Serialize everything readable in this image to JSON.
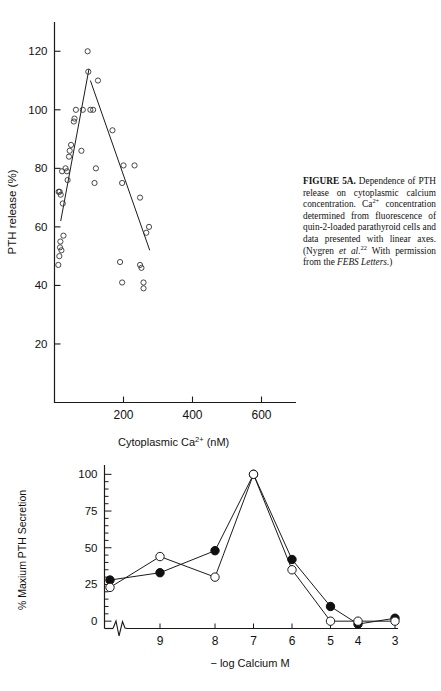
{
  "figure": {
    "caption": {
      "label": "FIGURE 5A.",
      "body_part1": " Dependence of PTH release on cytoplasmic calcium concentration. Ca",
      "sup1": "2+",
      "body_part2": " concentration determined from fluorescence of quin-2-loaded parathyroid cells and data presented with linear axes. (Nygren ",
      "italic1": "et al.",
      "sup2": "22",
      "body_part3": " With permission from the ",
      "italic2": "FEBS Letters.",
      "body_part4": ")"
    }
  },
  "chart_data": [
    {
      "id": "top-scatter",
      "type": "scatter",
      "title": "",
      "xlabel": "Cytoplasmic Ca2+ (nM)",
      "xlabel_base": "Cytoplasmic Ca",
      "xlabel_sup": "2+",
      "xlabel_unit": "(nM)",
      "ylabel": "PTH release (%)",
      "xlim": [
        0,
        700
      ],
      "ylim": [
        0,
        130
      ],
      "xticks": [
        200,
        400,
        600
      ],
      "yticks": [
        20,
        40,
        60,
        80,
        100,
        120
      ],
      "grid": false,
      "legend": "none",
      "marker": "open-circle",
      "points": [
        [
          11,
          47
        ],
        [
          14,
          50
        ],
        [
          16,
          53
        ],
        [
          17,
          55
        ],
        [
          20,
          52
        ],
        [
          26,
          57
        ],
        [
          12,
          72
        ],
        [
          15,
          72
        ],
        [
          18,
          71
        ],
        [
          24,
          68
        ],
        [
          22,
          79
        ],
        [
          32,
          80
        ],
        [
          36,
          79
        ],
        [
          38,
          76
        ],
        [
          42,
          84
        ],
        [
          44,
          86
        ],
        [
          48,
          88
        ],
        [
          56,
          96
        ],
        [
          58,
          97
        ],
        [
          62,
          100
        ],
        [
          78,
          86
        ],
        [
          82,
          100
        ],
        [
          96,
          120
        ],
        [
          98,
          113
        ],
        [
          104,
          100
        ],
        [
          112,
          100
        ],
        [
          126,
          110
        ],
        [
          120,
          80
        ],
        [
          116,
          75
        ],
        [
          168,
          93
        ],
        [
          200,
          81
        ],
        [
          232,
          81
        ],
        [
          196,
          75
        ],
        [
          248,
          70
        ],
        [
          274,
          60
        ],
        [
          266,
          58
        ],
        [
          190,
          48
        ],
        [
          196,
          41
        ],
        [
          248,
          47
        ],
        [
          252,
          46
        ],
        [
          258,
          41
        ],
        [
          258,
          39
        ]
      ],
      "fit_lines": [
        {
          "name": "ascending-fit",
          "x1": 18,
          "y1": 62,
          "x2": 100,
          "y2": 114
        },
        {
          "name": "descending-fit",
          "x1": 104,
          "y1": 110,
          "x2": 276,
          "y2": 52
        }
      ]
    },
    {
      "id": "bottom-line",
      "type": "line",
      "title": "",
      "xlabel": "− log Calcium M",
      "ylabel": "% Maxium PTH Secretion",
      "categories": [
        9,
        8,
        7,
        6,
        5,
        4,
        3
      ],
      "xticks": [
        9,
        8,
        7,
        6,
        5,
        4,
        3
      ],
      "yticks": [
        0,
        25,
        50,
        75,
        100
      ],
      "ylim": [
        -5,
        105
      ],
      "grid": false,
      "axis_break": true,
      "legend": "none",
      "series": [
        {
          "name": "filled-circle-series",
          "marker": "filled-circle",
          "x": [
            "origin",
            9,
            8,
            7,
            6,
            5,
            4,
            3
          ],
          "values": [
            28,
            33,
            48,
            100,
            42,
            10,
            -2,
            2
          ]
        },
        {
          "name": "open-circle-series",
          "marker": "open-circle",
          "x": [
            "origin",
            9,
            8,
            7,
            6,
            5,
            4,
            3
          ],
          "values": [
            23,
            44,
            30,
            100,
            35,
            0,
            0,
            0
          ]
        }
      ]
    }
  ]
}
